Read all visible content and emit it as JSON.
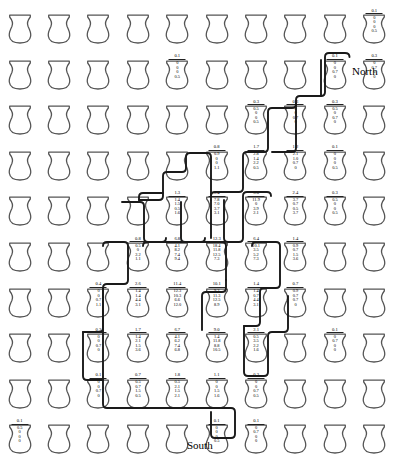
{
  "figure": {
    "type": "spatial-glyph-grid",
    "glyph": "vessel-icon",
    "rows": 10,
    "cols": 10,
    "direction_labels": {
      "north": "North",
      "south": "South"
    },
    "contour_color": "#1a1a1a",
    "glyph_stroke": "#555555",
    "glyph_fill": "#ffffff"
  },
  "chart_data": {
    "type": "heatmap",
    "title": "",
    "xlabel": "",
    "ylabel": "",
    "grid": true,
    "legend_position": "none",
    "annotations": [
      "North",
      "South"
    ],
    "value_fields": [
      "total",
      "q1",
      "q2",
      "q3",
      "q4"
    ],
    "cells": [
      [
        null,
        null,
        null,
        null,
        null,
        null,
        null,
        null,
        null,
        {
          "total": "0.1",
          "q1": "0",
          "q2": "0",
          "q3": "0",
          "q4": "0.5"
        }
      ],
      [
        null,
        null,
        null,
        null,
        {
          "total": "0.1",
          "q1": "0",
          "q2": "0",
          "q3": "0",
          "q4": "0.5"
        },
        null,
        null,
        null,
        {
          "total": "0.1",
          "q1": "0",
          "q2": "0",
          "q3": "0.7",
          "q4": "0"
        },
        {
          "total": "0.3",
          "q1": "0",
          "q2": "0.7",
          "q3": "0",
          "q4": "0"
        }
      ],
      [
        null,
        null,
        null,
        null,
        null,
        null,
        {
          "total": "0.3",
          "q1": "0.5",
          "q2": "0",
          "q3": "0",
          "q4": "0.5"
        },
        {
          "total": "0.3",
          "q1": "0",
          "q2": "0",
          "q3": "0.7",
          "q4": "0"
        },
        {
          "total": "0.3",
          "q1": "0.5",
          "q2": "0",
          "q3": "0.7",
          "q4": "0"
        },
        null
      ],
      [
        null,
        null,
        null,
        null,
        null,
        {
          "total": "0.8",
          "q1": "0.9",
          "q2": "0",
          "q3": "0",
          "q4": "1.1"
        },
        {
          "total": "1.7",
          "q1": "2.8",
          "q2": "1.4",
          "q3": "2.2",
          "q4": "0.5"
        },
        {
          "total": "1.2",
          "q1": "2.1",
          "q2": "1.0",
          "q3": "0.7",
          "q4": "0"
        },
        {
          "total": "0.1",
          "q1": "0",
          "q2": "0",
          "q3": "0",
          "q4": "0.5"
        },
        null
      ],
      [
        null,
        null,
        null,
        null,
        {
          "total": "1.3",
          "q1": "1.4",
          "q2": "1.5",
          "q3": "0.5",
          "q4": "1.6"
        },
        {
          "total": "5.4",
          "q1": "7.8",
          "q2": "7.0",
          "q3": "3.7",
          "q4": "3.1"
        },
        {
          "total": "5.0",
          "q1": "11.9",
          "q2": "0",
          "q3": "3.9",
          "q4": "2.1"
        },
        {
          "total": "2.4",
          "q1": "3.7",
          "q2": "0.7",
          "q3": "0.5",
          "q4": "3.7"
        },
        {
          "total": "0.3",
          "q1": "0.5",
          "q2": "0",
          "q3": "0",
          "q4": "0.5"
        },
        null
      ],
      [
        null,
        null,
        null,
        {
          "total": "0.8",
          "q1": "0.5",
          "q2": "0",
          "q3": "2.2",
          "q4": "1.1"
        },
        {
          "total": "6.8",
          "q1": "4.1",
          "q2": "8.2",
          "q3": "7.4",
          "q4": "9.4"
        },
        {
          "total": "12.3",
          "q1": "18.4",
          "q2": "11.8",
          "q3": "12.5",
          "q4": "7.3"
        },
        {
          "total": "6.4",
          "q1": "10.1",
          "q2": "3.5",
          "q3": "5.2",
          "q4": "7.3"
        },
        {
          "total": "1.4",
          "q1": "0.9",
          "q2": "0.7",
          "q3": "1.5",
          "q4": "3.6"
        },
        null,
        null
      ],
      [
        null,
        null,
        {
          "total": "0.4",
          "q1": "0",
          "q2": "0",
          "q3": "0.7",
          "q4": "1.1"
        },
        {
          "total": "2.6",
          "q1": "1.4",
          "q2": "1.4",
          "q3": "4.4",
          "q4": "3.1"
        },
        {
          "total": "11.4",
          "q1": "12.3",
          "q2": "10.3",
          "q3": "6.6",
          "q4": "12.0"
        },
        {
          "total": "10.1",
          "q1": "9.2",
          "q2": "11.3",
          "q3": "12.5",
          "q4": "8.9"
        },
        {
          "total": "1.4",
          "q1": "1.4",
          "q2": "0.7",
          "q3": "4.4",
          "q4": "3.1"
        },
        {
          "total": "0.7",
          "q1": "0.9",
          "q2": "0.7",
          "q3": "0.7",
          "q4": "0"
        },
        null,
        null
      ],
      [
        null,
        null,
        {
          "total": "0.3",
          "q1": "0",
          "q2": "0",
          "q3": "0.7",
          "q4": "0"
        },
        {
          "total": "1.7",
          "q1": "1.4",
          "q2": "2.1",
          "q3": "1.5",
          "q4": "3.6"
        },
        {
          "total": "6.7",
          "q1": "4.1",
          "q2": "6.2",
          "q3": "7.4",
          "q4": "6.8"
        },
        {
          "total": "9.0",
          "q1": "1.4",
          "q2": "11.8",
          "q3": "8.8",
          "q4": "10.5"
        },
        {
          "total": "2.1",
          "q1": "0.5",
          "q2": "3.5",
          "q3": "2.2",
          "q4": "1.6"
        },
        null,
        {
          "total": "0.1",
          "q1": "0",
          "q2": "0.7",
          "q3": "0",
          "q4": "0"
        },
        null
      ],
      [
        null,
        null,
        {
          "total": "0.1",
          "q1": "0",
          "q2": "0",
          "q3": "0.7",
          "q4": "0"
        },
        {
          "total": "0.7",
          "q1": "0.5",
          "q2": "0.7",
          "q3": "1.5",
          "q4": "0.5"
        },
        {
          "total": "1.8",
          "q1": "0.5",
          "q2": "2.1",
          "q3": "1.5",
          "q4": "2.1"
        },
        {
          "total": "1.1",
          "q1": "0",
          "q2": "0",
          "q3": "1.5",
          "q4": "1.6"
        },
        {
          "total": "0.3",
          "q1": "0",
          "q2": "0",
          "q3": "0.7",
          "q4": "0.5"
        },
        null,
        null,
        null
      ],
      [
        {
          "total": "0.1",
          "q1": "0.5",
          "q2": "0",
          "q3": "0",
          "q4": "0"
        },
        null,
        null,
        null,
        null,
        {
          "total": "0.1",
          "q1": "0",
          "q2": "0",
          "q3": "0",
          "q4": "0.5"
        },
        {
          "total": "0.1",
          "q1": "0",
          "q2": "0.7",
          "q3": "0",
          "q4": "0"
        },
        null,
        null,
        null
      ]
    ]
  }
}
